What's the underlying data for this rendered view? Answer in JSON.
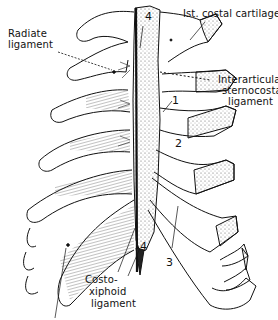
{
  "figure": {
    "colors": {
      "ink": "#111111",
      "background": "#ffffff",
      "stipple": "#444444"
    }
  },
  "labels": {
    "radiate_ligament": {
      "line1": "Radiate",
      "line2": "ligament"
    },
    "first_costal_cartilage": "Ist. costal cartilage",
    "interarticular": {
      "line1": "Interarticular",
      "line2": "sternocostal",
      "line3": "ligament"
    },
    "costoxiphoid": {
      "line1": "Costo-",
      "line2": "xiphoid",
      "line3": "ligament"
    }
  },
  "numbers": {
    "top_4": "4",
    "n1": "1",
    "n2": "2",
    "n3": "3",
    "bottom_4": "4"
  }
}
